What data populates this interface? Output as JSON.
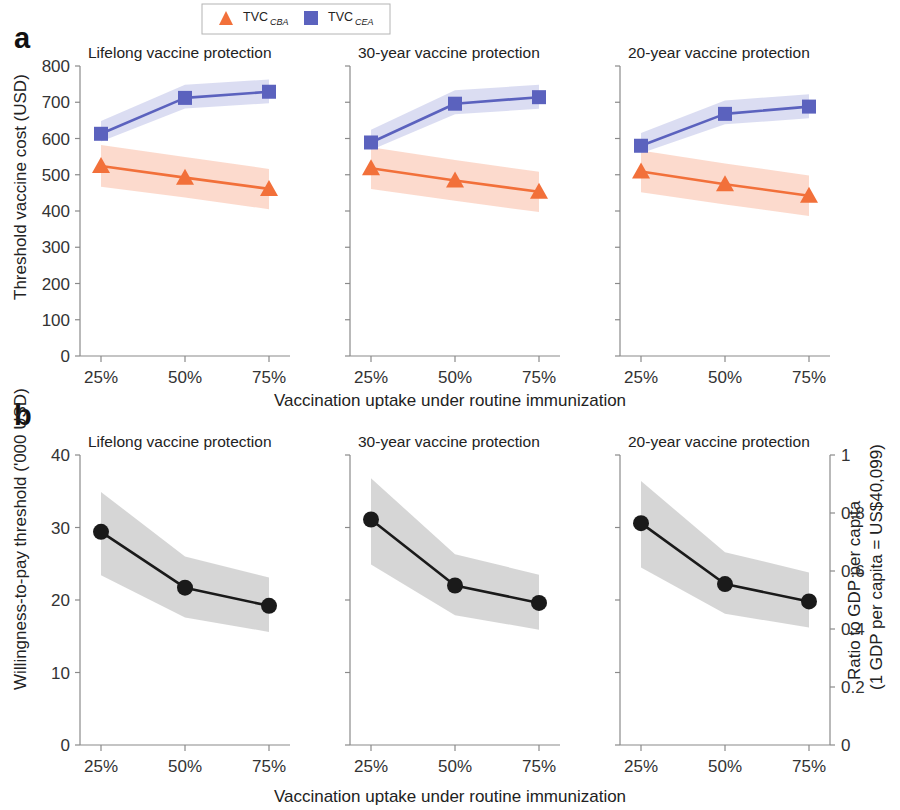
{
  "figure": {
    "panels": [
      {
        "letter": "a"
      },
      {
        "letter": "b"
      }
    ],
    "xaxis_title": "Vaccination uptake under routine immunization",
    "xaxis_title_b": "Vaccination uptake under routine immunization"
  },
  "legend": {
    "items": [
      {
        "base": "TVC",
        "sub": "CBA",
        "marker": "triangle-marker",
        "color": "#F2703A"
      },
      {
        "base": "TVC",
        "sub": "CEA",
        "marker": "square-marker",
        "color": "#5B62BE"
      }
    ]
  },
  "colors": {
    "cba_line": "#F2703A",
    "cba_band": "#FBD3C4",
    "cea_line": "#5B62BE",
    "cea_band": "#D5D7F0",
    "wtp_line": "#1A1A1A",
    "wtp_band": "#CFCFCF",
    "axis": "#8A8A8A"
  },
  "chart_data": [
    {
      "type": "line",
      "panel": "a",
      "subplot": "Lifelong vaccine protection",
      "title": "Lifelong vaccine protection",
      "xlabel": "Vaccination uptake under routine immunization",
      "ylabel": "Threshold vaccine cost (USD)",
      "categories": [
        "25%",
        "50%",
        "75%"
      ],
      "x": [
        25,
        50,
        75
      ],
      "ylim": [
        0,
        800
      ],
      "yticks": [
        0,
        100,
        200,
        300,
        400,
        500,
        600,
        700,
        800
      ],
      "grid": false,
      "legend_position": "top-center",
      "series": [
        {
          "name": "TVC_CBA",
          "values": [
            524,
            492,
            461
          ],
          "band_low": [
            467,
            437,
            405
          ],
          "band_high": [
            582,
            549,
            516
          ]
        },
        {
          "name": "TVC_CEA",
          "values": [
            613,
            712,
            729
          ],
          "band_low": [
            592,
            683,
            697
          ],
          "band_high": [
            648,
            748,
            763
          ]
        }
      ]
    },
    {
      "type": "line",
      "panel": "a",
      "subplot": "30-year vaccine protection",
      "title": "30-year vaccine protection",
      "xlabel": "Vaccination uptake under routine immunization",
      "ylabel": "Threshold vaccine cost (USD)",
      "categories": [
        "25%",
        "50%",
        "75%"
      ],
      "x": [
        25,
        50,
        75
      ],
      "ylim": [
        0,
        800
      ],
      "yticks": [
        0,
        100,
        200,
        300,
        400,
        500,
        600,
        700,
        800
      ],
      "grid": false,
      "series": [
        {
          "name": "TVC_CBA",
          "values": [
            518,
            484,
            453
          ],
          "band_low": [
            461,
            428,
            397
          ],
          "band_high": [
            576,
            541,
            508
          ]
        },
        {
          "name": "TVC_CEA",
          "values": [
            589,
            696,
            714
          ],
          "band_low": [
            568,
            667,
            682
          ],
          "band_high": [
            624,
            733,
            748
          ]
        }
      ]
    },
    {
      "type": "line",
      "panel": "a",
      "subplot": "20-year vaccine protection",
      "title": "20-year vaccine protection",
      "xlabel": "Vaccination uptake under routine immunization",
      "ylabel": "Threshold vaccine cost (USD)",
      "categories": [
        "25%",
        "50%",
        "75%"
      ],
      "x": [
        25,
        50,
        75
      ],
      "ylim": [
        0,
        800
      ],
      "yticks": [
        0,
        100,
        200,
        300,
        400,
        500,
        600,
        700,
        800
      ],
      "grid": false,
      "series": [
        {
          "name": "TVC_CBA",
          "values": [
            509,
            474,
            442
          ],
          "band_low": [
            452,
            418,
            386
          ],
          "band_high": [
            567,
            531,
            498
          ]
        },
        {
          "name": "TVC_CEA",
          "values": [
            580,
            668,
            688
          ],
          "band_low": [
            559,
            639,
            656
          ],
          "band_high": [
            615,
            705,
            722
          ]
        }
      ]
    },
    {
      "type": "line",
      "panel": "b",
      "subplot": "Lifelong vaccine protection",
      "title": "Lifelong vaccine protection",
      "xlabel": "Vaccination uptake under routine immunization",
      "ylabel": "Willingness-to-pay threshold ('000 USD)",
      "y2label": "Ratio to GDP per capita (1 GDP per capita = US$40,099)",
      "categories": [
        "25%",
        "50%",
        "75%"
      ],
      "x": [
        25,
        50,
        75
      ],
      "ylim": [
        0,
        40
      ],
      "yticks": [
        0,
        10,
        20,
        30,
        40
      ],
      "y2lim": [
        0,
        1
      ],
      "y2ticks": [
        0,
        0.2,
        0.4,
        0.6,
        0.8,
        1
      ],
      "grid": false,
      "series": [
        {
          "name": "WTP threshold",
          "values": [
            29.4,
            21.7,
            19.2
          ],
          "band_low": [
            23.4,
            17.6,
            15.6
          ],
          "band_high": [
            34.9,
            26.0,
            23.1
          ]
        }
      ]
    },
    {
      "type": "line",
      "panel": "b",
      "subplot": "30-year vaccine protection",
      "title": "30-year vaccine protection",
      "xlabel": "Vaccination uptake under routine immunization",
      "ylabel": "Willingness-to-pay threshold ('000 USD)",
      "categories": [
        "25%",
        "50%",
        "75%"
      ],
      "x": [
        25,
        50,
        75
      ],
      "ylim": [
        0,
        40
      ],
      "yticks": [
        0,
        10,
        20,
        30,
        40
      ],
      "grid": false,
      "series": [
        {
          "name": "WTP threshold",
          "values": [
            31.1,
            22.0,
            19.6
          ],
          "band_low": [
            24.9,
            17.9,
            15.9
          ],
          "band_high": [
            36.8,
            26.3,
            23.5
          ]
        }
      ]
    },
    {
      "type": "line",
      "panel": "b",
      "subplot": "20-year vaccine protection",
      "title": "20-year vaccine protection",
      "xlabel": "Vaccination uptake under routine immunization",
      "ylabel": "Willingness-to-pay threshold ('000 USD)",
      "y2label": "Ratio to GDP per capita (1 GDP per capita = US$40,099)",
      "categories": [
        "25%",
        "50%",
        "75%"
      ],
      "x": [
        25,
        50,
        75
      ],
      "ylim": [
        0,
        40
      ],
      "yticks": [
        0,
        10,
        20,
        30,
        40
      ],
      "y2lim": [
        0,
        1
      ],
      "y2ticks": [
        0,
        0.2,
        0.4,
        0.6,
        0.8,
        1
      ],
      "grid": false,
      "series": [
        {
          "name": "WTP threshold",
          "values": [
            30.6,
            22.2,
            19.8
          ],
          "band_low": [
            24.5,
            18.1,
            16.2
          ],
          "band_high": [
            36.4,
            26.6,
            23.8
          ]
        }
      ]
    }
  ],
  "axes": {
    "a": {
      "ylabel": "Threshold vaccine cost (USD)",
      "yticks": [
        "800",
        "700",
        "600",
        "500",
        "400",
        "300",
        "200",
        "100",
        "0"
      ],
      "xticks": [
        "25%",
        "50%",
        "75%"
      ]
    },
    "b": {
      "ylabel": "Willingness-to-pay threshold ('000 USD)",
      "y2label_line1": "Ratio to GDP per capita",
      "y2label_line2": "(1 GDP per capita = US$40,099)",
      "yticks": [
        "40",
        "30",
        "20",
        "10",
        "0"
      ],
      "y2ticks": [
        "1",
        "0.8",
        "0.6",
        "0.4",
        "0.2",
        "0"
      ],
      "xticks": [
        "25%",
        "50%",
        "75%"
      ]
    }
  },
  "titles": {
    "lifelong": "Lifelong vaccine protection",
    "thirty": "30-year vaccine protection",
    "twenty": "20-year vaccine protection"
  }
}
